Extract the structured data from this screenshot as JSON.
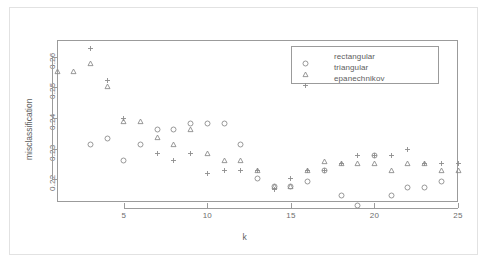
{
  "chart_data": {
    "type": "scatter",
    "title": "",
    "xlabel": "k",
    "ylabel": "misclassification",
    "xlim": [
      1,
      25
    ],
    "ylim": [
      0.2125,
      0.2655
    ],
    "xticks": [
      5,
      10,
      15,
      20,
      25
    ],
    "xtick_labels": [
      "5",
      "10",
      "15",
      "20",
      "25"
    ],
    "yticks": [
      0.22,
      0.23,
      0.24,
      0.25,
      0.26
    ],
    "ytick_labels": [
      "0.22",
      "0.23",
      "0.24",
      "0.25",
      "0.26"
    ],
    "grid": false,
    "legend_position": "top-right",
    "x": [
      1,
      2,
      3,
      4,
      5,
      6,
      7,
      8,
      9,
      10,
      11,
      12,
      13,
      14,
      15,
      16,
      17,
      18,
      19,
      20,
      21,
      22,
      23,
      24,
      25
    ],
    "series": [
      {
        "name": "rectangular",
        "marker": "circle",
        "values": [
          null,
          null,
          0.2335,
          0.2355,
          0.2285,
          0.2335,
          0.2385,
          0.2385,
          0.2405,
          0.2405,
          0.2405,
          0.2335,
          0.2225,
          0.22,
          0.22,
          0.2215,
          0.225,
          0.217,
          0.2135,
          0.23,
          0.217,
          0.2195,
          0.2195,
          0.2215,
          null
        ]
      },
      {
        "name": "triangular",
        "marker": "triangle",
        "values": [
          0.2575,
          0.2575,
          0.26,
          0.2525,
          0.241,
          0.241,
          0.236,
          0.2335,
          0.2385,
          0.2305,
          0.2285,
          0.2285,
          0.225,
          0.22,
          0.22,
          0.225,
          0.228,
          0.2275,
          0.2275,
          0.2275,
          0.225,
          0.2275,
          0.2275,
          0.225,
          0.225
        ]
      },
      {
        "name": "epanechnikov",
        "marker": "plus",
        "values": [
          null,
          null,
          0.265,
          0.2545,
          0.242,
          null,
          0.2305,
          0.2285,
          0.2305,
          0.224,
          0.225,
          0.225,
          0.225,
          0.219,
          0.2225,
          0.225,
          0.225,
          0.2275,
          0.23,
          0.23,
          0.23,
          0.232,
          0.2275,
          0.2275,
          0.2275
        ]
      }
    ]
  },
  "axes": {
    "x_title": "k",
    "y_title": "misclassification"
  },
  "legend": {
    "items": [
      {
        "label": "rectangular",
        "marker": "circle-marker"
      },
      {
        "label": "triangular",
        "marker": "triangle-marker"
      },
      {
        "label": "epanechnikov",
        "marker": "plus-marker"
      }
    ]
  },
  "colors": {
    "frame": "#9b9b9b",
    "text": "#5d5d5d",
    "marker": "#8c8c8c",
    "background": "#ffffff"
  }
}
